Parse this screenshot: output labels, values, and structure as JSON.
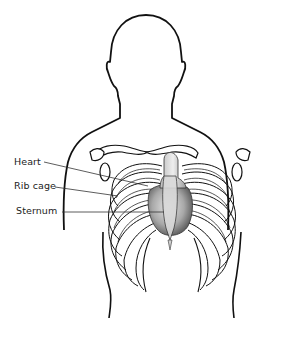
{
  "diagram": {
    "labels": [
      {
        "id": "heart",
        "text": "Heart",
        "x": 14,
        "y": 156
      },
      {
        "id": "rib-cage",
        "text": "Rib cage",
        "x": 14,
        "y": 180
      },
      {
        "id": "sternum",
        "text": "Sternum",
        "x": 16,
        "y": 205
      }
    ],
    "colors": {
      "outline": "#111111",
      "heart_fill": "#9a9a9a",
      "background": "#ffffff"
    }
  }
}
